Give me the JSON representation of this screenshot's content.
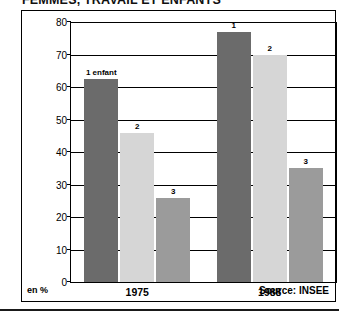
{
  "title": "FEMMES, TRAVAIL ET ENFANTS",
  "credit": "L'Histoire, n° 150, décembre 1991, p. 42",
  "footer": {
    "unit": "en %",
    "source": "Source: INSEE"
  },
  "colors": {
    "series_1": "#6b6b6b",
    "series_2": "#d6d6d6",
    "series_3": "#9b9b9b",
    "axis": "#000000",
    "background": "#ffffff"
  },
  "chart_data": {
    "type": "bar",
    "title": "FEMMES, TRAVAIL ET ENFANTS",
    "xlabel": "",
    "ylabel": "en %",
    "ylim": [
      0,
      80
    ],
    "yticks": [
      0,
      10,
      20,
      30,
      40,
      50,
      60,
      70,
      80
    ],
    "ytick_labels": [
      "0",
      "10",
      "20",
      "30",
      "40",
      "50",
      "60",
      "70",
      "80"
    ],
    "grid": true,
    "legend": "none",
    "categories": [
      "1975",
      "1988"
    ],
    "series": [
      {
        "name": "1 enfant",
        "label": "1 enfant",
        "color": "#6b6b6b",
        "values": [
          62.5,
          77
        ],
        "point_labels": [
          "1 enfant",
          "1"
        ]
      },
      {
        "name": "2 enfants",
        "label": "2",
        "color": "#d6d6d6",
        "values": [
          46,
          70
        ],
        "point_labels": [
          "2",
          "2"
        ]
      },
      {
        "name": "3 enfants",
        "label": "3",
        "color": "#9b9b9b",
        "values": [
          26,
          35
        ],
        "point_labels": [
          "3",
          "3"
        ]
      }
    ],
    "annotations": [
      "en %",
      "Source: INSEE"
    ]
  }
}
